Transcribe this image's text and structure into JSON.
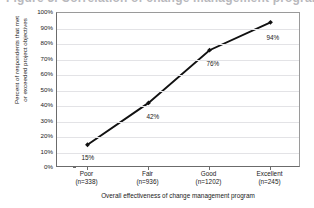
{
  "figure": {
    "clipped_title": "Figure 3. Correlation of change management program"
  },
  "chart_data": {
    "type": "line",
    "title": "",
    "xlabel": "Overall effectiveness of change management program",
    "ylabel": "Percent of respondents that met or exceeded project objectives",
    "ylabel_line1": "Percent of respondents that met",
    "ylabel_line2": "or exceeded project objectives",
    "categories": [
      "Poor",
      "Fair",
      "Good",
      "Excellent"
    ],
    "category_sublabels": [
      "(n=338)",
      "(n=936)",
      "(n=1202)",
      "(n=245)"
    ],
    "sample_sizes": [
      338,
      936,
      1202,
      245
    ],
    "values": [
      15,
      42,
      76,
      94
    ],
    "point_labels": [
      "15%",
      "42%",
      "76%",
      "94%"
    ],
    "ylim": [
      0,
      100
    ],
    "ytick_values": [
      0,
      10,
      20,
      30,
      40,
      50,
      60,
      70,
      80,
      90,
      100
    ],
    "ytick_labels": [
      "0%",
      "10%",
      "20%",
      "30%",
      "40%",
      "50%",
      "60%",
      "70%",
      "80%",
      "90%",
      "100%"
    ],
    "grid": true,
    "grid_axis": "y",
    "legend": false,
    "legend_position": "none",
    "series_color": "#111111",
    "grid_color": "#e3e3e6",
    "axis_color": "#6b6b6b",
    "marker": "diamond"
  }
}
